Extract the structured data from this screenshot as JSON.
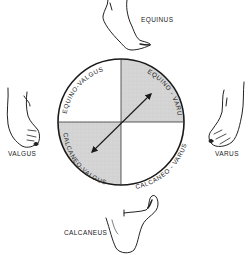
{
  "diagram": {
    "type": "foot-deformity-circle",
    "quadrants": [
      {
        "position": "top-left",
        "label": "EQUINO-VALGUS",
        "shaded": false
      },
      {
        "position": "top-right",
        "label": "EQUINO - VARUS",
        "shaded": true
      },
      {
        "position": "bottom-left",
        "label": "CALCANEO-VALGUS",
        "shaded": true
      },
      {
        "position": "bottom-right",
        "label": "CALCANEO - VARUS",
        "shaded": false
      }
    ],
    "feet": {
      "top": "EQUINUS",
      "left": "VALGUS",
      "right": "VARUS",
      "bottom": "CALCANEUS"
    },
    "arrow": {
      "from": "bottom-left",
      "to": "top-right",
      "double_headed": true
    },
    "colors": {
      "shade": "#d6d6d6",
      "line": "#1a1a1a",
      "background": "#ffffff"
    }
  }
}
